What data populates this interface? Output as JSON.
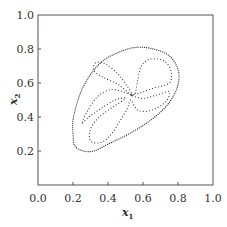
{
  "chart_data": {
    "type": "line",
    "title": "",
    "xlabel": "x1",
    "ylabel": "x2",
    "xlabel_main": "x",
    "xlabel_sub": "1",
    "ylabel_main": "x",
    "ylabel_sub": "2",
    "xlim": [
      0.0,
      1.0
    ],
    "ylim": [
      0.0,
      1.0
    ],
    "grid": false,
    "legend": null,
    "x_ticks": [
      "0.0",
      "0.2",
      "0.4",
      "0.6",
      "0.8",
      "1.0"
    ],
    "x_tick_values": [
      0.0,
      0.2,
      0.4,
      0.6,
      0.8,
      1.0
    ],
    "y_ticks": [
      "0.2",
      "0.4",
      "0.6",
      "0.8",
      "1.0"
    ],
    "y_tick_values": [
      0.2,
      0.4,
      0.6,
      0.8,
      1.0
    ],
    "series": [
      {
        "name": "outer-boundary",
        "style": "dotted",
        "closed": true,
        "points": [
          [
            0.56,
            0.81
          ],
          [
            0.66,
            0.8
          ],
          [
            0.75,
            0.76
          ],
          [
            0.8,
            0.68
          ],
          [
            0.8,
            0.59
          ],
          [
            0.76,
            0.5
          ],
          [
            0.69,
            0.42
          ],
          [
            0.6,
            0.35
          ],
          [
            0.5,
            0.29
          ],
          [
            0.4,
            0.24
          ],
          [
            0.32,
            0.2
          ],
          [
            0.26,
            0.2
          ],
          [
            0.21,
            0.23
          ],
          [
            0.2,
            0.3
          ],
          [
            0.2,
            0.38
          ],
          [
            0.22,
            0.47
          ],
          [
            0.25,
            0.56
          ],
          [
            0.3,
            0.65
          ],
          [
            0.37,
            0.73
          ],
          [
            0.46,
            0.78
          ]
        ]
      },
      {
        "name": "inner-petals",
        "style": "dotted",
        "closed": true,
        "points": [
          [
            0.53,
            0.53
          ],
          [
            0.46,
            0.59
          ],
          [
            0.38,
            0.63
          ],
          [
            0.32,
            0.67
          ],
          [
            0.33,
            0.72
          ],
          [
            0.39,
            0.71
          ],
          [
            0.46,
            0.65
          ],
          [
            0.51,
            0.58
          ],
          [
            0.55,
            0.53
          ],
          [
            0.57,
            0.62
          ],
          [
            0.59,
            0.7
          ],
          [
            0.64,
            0.74
          ],
          [
            0.72,
            0.73
          ],
          [
            0.76,
            0.67
          ],
          [
            0.75,
            0.6
          ],
          [
            0.66,
            0.57
          ],
          [
            0.58,
            0.54
          ],
          [
            0.53,
            0.53
          ],
          [
            0.6,
            0.51
          ],
          [
            0.68,
            0.53
          ],
          [
            0.75,
            0.55
          ],
          [
            0.73,
            0.49
          ],
          [
            0.65,
            0.44
          ],
          [
            0.57,
            0.44
          ],
          [
            0.53,
            0.5
          ],
          [
            0.51,
            0.45
          ],
          [
            0.47,
            0.38
          ],
          [
            0.42,
            0.3
          ],
          [
            0.36,
            0.25
          ],
          [
            0.3,
            0.26
          ],
          [
            0.3,
            0.33
          ],
          [
            0.35,
            0.4
          ],
          [
            0.43,
            0.46
          ],
          [
            0.5,
            0.51
          ],
          [
            0.44,
            0.5
          ],
          [
            0.36,
            0.45
          ],
          [
            0.29,
            0.4
          ],
          [
            0.25,
            0.36
          ],
          [
            0.28,
            0.43
          ],
          [
            0.34,
            0.52
          ],
          [
            0.41,
            0.56
          ],
          [
            0.48,
            0.55
          ],
          [
            0.53,
            0.53
          ]
        ]
      }
    ]
  }
}
